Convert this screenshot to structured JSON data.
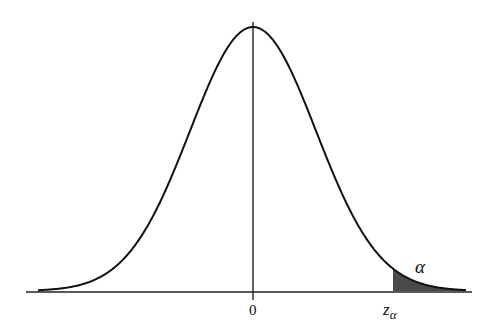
{
  "diagram": {
    "type": "normal-distribution-upper-tail",
    "labels": {
      "center": "0",
      "critical_value_base": "z",
      "critical_value_sub": "α",
      "tail_area": "α"
    },
    "colors": {
      "curve": "#111111",
      "axis": "#222222",
      "shaded_tail": "#444444",
      "background": "#ffffff"
    }
  },
  "chart_data": {
    "type": "area",
    "title": "",
    "xlabel": "",
    "ylabel": "",
    "x_ticks": [
      "0",
      "zα"
    ],
    "annotations": [
      {
        "text": "α",
        "position": "upper tail beyond zα"
      }
    ],
    "series": [
      {
        "name": "standard normal density",
        "mean": 0,
        "sd": 1,
        "x_range": [
          -3.4,
          3.4
        ]
      }
    ],
    "shaded_region": {
      "from": "zα",
      "to": "+∞",
      "area_label": "α",
      "approx_z": 2.1
    },
    "grid": false,
    "legend": false
  }
}
